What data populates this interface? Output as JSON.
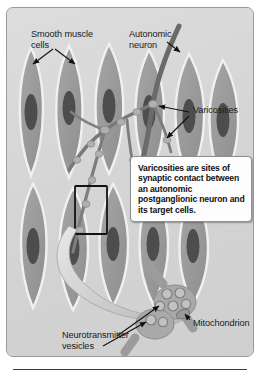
{
  "figure": {
    "title_region": "smooth-muscle-autonomic-innervation-diagram",
    "panel_bg": "#d6d6d6",
    "line_color": "#1a1a1a"
  },
  "labels": {
    "smooth_muscle": "Smooth muscle\ncells",
    "autonomic_neuron": "Autonomic\nneuron",
    "varicosities": "Varicosities",
    "neurotransmitter_vesicles": "Neurotransmitter\nvesicles",
    "mitochondrion": "Mitochondrion"
  },
  "callout": {
    "text": "Varicosities are sites of synaptic contact between an autonomic postganglionic neuron and its target cells."
  },
  "colors": {
    "cell_fill": "#9b9b9b",
    "cell_edge": "#f2f2f2",
    "nucleus": "#4a4a4a",
    "neuron_fiber": "#6d6d6d",
    "varicosity": "#a9a9a9",
    "arrow_big": "#cfcfcf",
    "panel": "#d6d6d6",
    "text": "#1a1a1a",
    "callout_bg": "#fdfdfd"
  },
  "structures": {
    "muscle_cell_count": 11,
    "varicosity_bead_count": 12,
    "inset_vesicle_count": 7,
    "inset_varicosity_count": 2,
    "highlight_box": "varicosity-contact-region"
  }
}
